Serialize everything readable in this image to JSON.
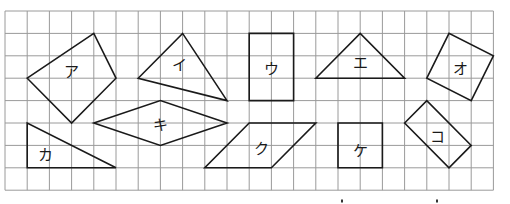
{
  "grid": {
    "origin_x": 5,
    "origin_y": 11,
    "cell_w": 22.2,
    "cell_h": 22.4,
    "cols": 22,
    "rows": 8,
    "line_color": "#9a9a9a",
    "border_color": "#9a9a9a"
  },
  "stroke_color": "#1a1a1a",
  "shapes": [
    {
      "id": "a",
      "label": "ア",
      "points": [
        [
          1,
          3
        ],
        [
          4,
          1
        ],
        [
          5,
          3
        ],
        [
          3,
          5
        ]
      ],
      "label_pos": [
        3.0,
        2.75
      ]
    },
    {
      "id": "i",
      "label": "イ",
      "points": [
        [
          6,
          3
        ],
        [
          8,
          1
        ],
        [
          10,
          4
        ]
      ],
      "label_pos": [
        7.85,
        2.45
      ]
    },
    {
      "id": "u",
      "label": "ウ",
      "points": [
        [
          11,
          1
        ],
        [
          13,
          1
        ],
        [
          13,
          4
        ],
        [
          11,
          4
        ]
      ],
      "label_pos": [
        12.0,
        2.6
      ]
    },
    {
      "id": "e",
      "label": "エ",
      "points": [
        [
          14,
          3
        ],
        [
          16,
          1
        ],
        [
          18,
          3
        ]
      ],
      "label_pos": [
        16.0,
        2.35
      ]
    },
    {
      "id": "o",
      "label": "オ",
      "points": [
        [
          19,
          3
        ],
        [
          20,
          1
        ],
        [
          22,
          2
        ],
        [
          21,
          4
        ]
      ],
      "label_pos": [
        20.5,
        2.6
      ]
    },
    {
      "id": "ka",
      "label": "カ",
      "points": [
        [
          1,
          5
        ],
        [
          1,
          7
        ],
        [
          5,
          7
        ]
      ],
      "label_pos": [
        1.8,
        6.45
      ]
    },
    {
      "id": "ki",
      "label": "キ",
      "points": [
        [
          4,
          5
        ],
        [
          7,
          4
        ],
        [
          10,
          5
        ],
        [
          7,
          6
        ]
      ],
      "label_pos": [
        7.0,
        5.1
      ]
    },
    {
      "id": "ku",
      "label": "ク",
      "points": [
        [
          11,
          5
        ],
        [
          14,
          5
        ],
        [
          12,
          7
        ],
        [
          9,
          7
        ]
      ],
      "label_pos": [
        11.55,
        6.2
      ]
    },
    {
      "id": "ke",
      "label": "ケ",
      "points": [
        [
          15,
          5
        ],
        [
          17,
          5
        ],
        [
          17,
          7
        ],
        [
          15,
          7
        ]
      ],
      "label_pos": [
        16.0,
        6.25
      ]
    },
    {
      "id": "ko",
      "label": "コ",
      "points": [
        [
          18,
          5
        ],
        [
          19,
          4
        ],
        [
          21,
          6
        ],
        [
          20,
          7
        ]
      ],
      "label_pos": [
        19.5,
        5.65
      ]
    }
  ],
  "bottom_marks": [
    [
      342,
      201
    ],
    [
      437,
      201
    ]
  ]
}
